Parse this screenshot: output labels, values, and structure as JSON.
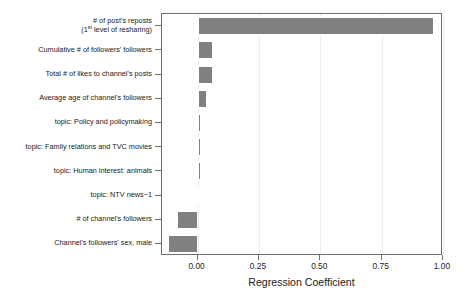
{
  "chart_data": {
    "type": "bar",
    "orientation": "horizontal",
    "title": "",
    "xlabel": "Regression Coefficient",
    "ylabel": "",
    "xlim": [
      -0.145,
      1.0
    ],
    "xticks": [
      0.0,
      0.25,
      0.5,
      0.75,
      1.0
    ],
    "xticklabels": [
      "0.00",
      "0.25",
      "0.50",
      "0.75",
      "1.00"
    ],
    "grid": true,
    "grid_axis": "x",
    "legend": null,
    "bar_color": "#808080",
    "bar_edge_color": "#ffffff",
    "axis_color": "#6e6e6e",
    "categories": [
      "# of post's reposts (1st level of resharing)",
      "Cumulative # of followers' followers",
      "Total # of likes to channel's posts",
      "Average age of channel's followers",
      "topic: Policy and policymaking",
      "topic: Family relations and TVC movies",
      "topic: Human interest: animals",
      "topic: NTV news−1",
      "# of channel's followers",
      "Channel's followers' sex, male"
    ],
    "values": [
      0.963,
      0.062,
      0.062,
      0.037,
      0.015,
      0.012,
      0.012,
      -0.004,
      -0.085,
      -0.121
    ]
  },
  "categories_display": [
    {
      "line1": "# of post's reposts",
      "line2_pre": "(1",
      "line2_sup": "st",
      "line2_post": " level of resharing)",
      "two_line": true
    },
    {
      "line1": "Cumulative # of followers' followers",
      "two_line": false
    },
    {
      "line1": "Total # of likes to channel's posts",
      "two_line": false
    },
    {
      "line1": "Average age of channel's followers",
      "two_line": false
    },
    {
      "line1": "topic: Policy and policymaking",
      "two_line": false
    },
    {
      "line1": "topic: Family relations and TVC movies",
      "two_line": false
    },
    {
      "line1": "topic: Human interest: animals",
      "two_line": false
    },
    {
      "line1": "topic: NTV news−1",
      "two_line": false
    },
    {
      "line1": "# of channel's followers",
      "two_line": false
    },
    {
      "line1": "Channel's followers' sex, male",
      "two_line": false
    }
  ],
  "axis": {
    "x_title": "Regression Coefficient",
    "tick_labels": [
      "0.00",
      "0.25",
      "0.50",
      "0.75",
      "1.00"
    ]
  }
}
